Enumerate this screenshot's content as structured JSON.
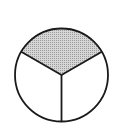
{
  "diagram": {
    "type": "fraction-circle",
    "parts": 3,
    "shaded_parts": 1,
    "colors": {
      "stroke": "#1a1a1a",
      "shaded_fill": "#c8c8c8",
      "unshaded_fill": "#ffffff"
    }
  }
}
